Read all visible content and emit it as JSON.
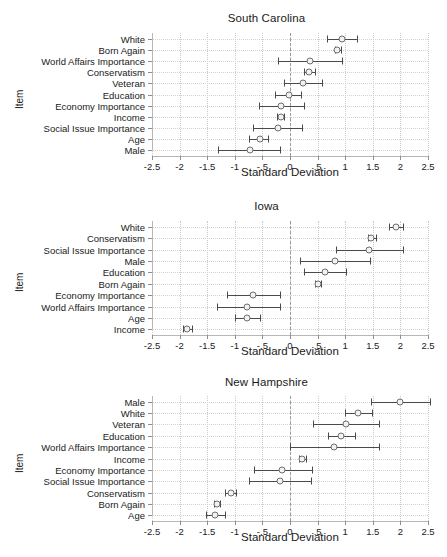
{
  "chart_data": [
    {
      "type": "scatter",
      "title": "South Carolina",
      "xlabel": "Standard Deviation",
      "ylabel": "Item",
      "xlim": [
        -2.5,
        2.5
      ],
      "xticks": [
        -2.5,
        -2,
        -1.5,
        -1,
        -0.5,
        0,
        0.5,
        1,
        1.5,
        2,
        2.5
      ],
      "xticklabels": [
        "-2.5",
        "-2",
        "-1.5",
        "-1",
        "-.5",
        "0",
        ".5",
        "1",
        "1.5",
        "2",
        "2.5"
      ],
      "grid": true,
      "legend": "none",
      "reference_line": 0,
      "categories": [
        "White",
        "Born Again",
        "World Affairs Importance",
        "Conservatism",
        "Veteran",
        "Education",
        "Economy Importance",
        "Income",
        "Social Issue Importance",
        "Age",
        "Male"
      ],
      "values": [
        0.95,
        0.86,
        0.37,
        0.35,
        0.23,
        -0.02,
        -0.17,
        -0.17,
        -0.22,
        -0.55,
        -0.73
      ],
      "ci_low": [
        0.67,
        0.81,
        -0.22,
        0.25,
        -0.1,
        -0.28,
        -0.56,
        -0.23,
        -0.67,
        -0.75,
        -1.3
      ],
      "ci_high": [
        1.22,
        0.92,
        0.95,
        0.45,
        0.58,
        0.2,
        0.25,
        -0.11,
        0.22,
        -0.4,
        -0.18
      ]
    },
    {
      "type": "scatter",
      "title": "Iowa",
      "xlabel": "Standard Deviation",
      "ylabel": "Item",
      "xlim": [
        -2.5,
        2.5
      ],
      "xticks": [
        -2.5,
        -2,
        -1.5,
        -1,
        -0.5,
        0,
        0.5,
        1,
        1.5,
        2,
        2.5
      ],
      "xticklabels": [
        "-2.5",
        "-2",
        "-1.5",
        "-1",
        "-.5",
        "0",
        ".5",
        "1",
        "1.5",
        "2",
        "2.5"
      ],
      "grid": true,
      "legend": "none",
      "reference_line": 0,
      "categories": [
        "White",
        "Conservatism",
        "Social Issue Importance",
        "Male",
        "Education",
        "Born Again",
        "Economy Importance",
        "World Affairs Importance",
        "Age",
        "Income"
      ],
      "values": [
        1.92,
        1.47,
        1.44,
        0.82,
        0.63,
        0.5,
        -0.67,
        -0.77,
        -0.78,
        -1.86
      ],
      "ci_low": [
        1.79,
        1.41,
        0.84,
        0.19,
        0.26,
        0.46,
        -1.15,
        -1.33,
        -1.0,
        -1.94
      ],
      "ci_high": [
        2.05,
        1.56,
        2.04,
        1.45,
        1.02,
        0.56,
        -0.19,
        -0.19,
        -0.55,
        -1.77
      ]
    },
    {
      "type": "scatter",
      "title": "New Hampshire",
      "xlabel": "Standard Deviation",
      "ylabel": "Item",
      "xlim": [
        -2.5,
        2.5
      ],
      "xticks": [
        -2.5,
        -2,
        -1.5,
        -1,
        -0.5,
        0,
        0.5,
        1,
        1.5,
        2,
        2.5
      ],
      "xticklabels": [
        "-2.5",
        "-2",
        "-1.5",
        "-1",
        "-.5",
        "0",
        ".5",
        "1",
        "1.5",
        "2",
        "2.5"
      ],
      "grid": true,
      "legend": "none",
      "reference_line": 0,
      "categories": [
        "Male",
        "White",
        "Veteran",
        "Education",
        "World Affairs Importance",
        "Income",
        "Economy Importance",
        "Social Issue Importance",
        "Conservatism",
        "Born Again",
        "Age"
      ],
      "values": [
        2.0,
        1.23,
        1.01,
        0.93,
        0.79,
        0.22,
        -0.14,
        -0.18,
        -1.07,
        -1.33,
        -1.35
      ],
      "ci_low": [
        1.46,
        1.0,
        0.42,
        0.68,
        0.0,
        0.16,
        -0.66,
        -0.74,
        -1.17,
        -1.38,
        -1.52
      ],
      "ci_high": [
        2.54,
        1.48,
        1.62,
        1.18,
        1.61,
        0.29,
        0.4,
        0.38,
        -0.97,
        -1.27,
        -1.17
      ]
    }
  ]
}
